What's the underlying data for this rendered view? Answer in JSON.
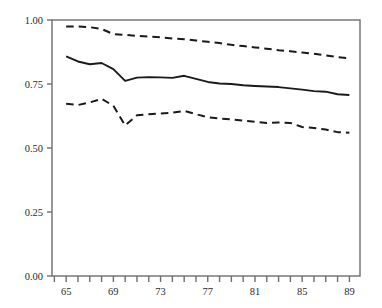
{
  "chart_data": {
    "type": "line",
    "title": "",
    "xlabel": "",
    "ylabel": "",
    "xlim": [
      63.8,
      89.9
    ],
    "ylim": [
      0.0,
      1.0
    ],
    "grid": false,
    "legend": "none",
    "y_ticks": [
      "0.00",
      "0.25",
      "0.50",
      "0.75",
      "1.00"
    ],
    "y_tick_values": [
      0.0,
      0.25,
      0.5,
      0.75,
      1.0
    ],
    "x_ticks": [
      "65",
      "69",
      "73",
      "77",
      "81",
      "85",
      "89"
    ],
    "x_tick_values": [
      65,
      69,
      73,
      77,
      81,
      85,
      89
    ],
    "x_minor_tick_values": [
      64,
      66,
      67,
      68,
      70,
      71,
      72,
      74,
      75,
      76,
      78,
      79,
      80,
      82,
      83,
      84,
      86,
      87,
      88
    ],
    "x": [
      65,
      66,
      67,
      68,
      69,
      70,
      71,
      72,
      73,
      74,
      75,
      76,
      77,
      78,
      79,
      80,
      81,
      82,
      83,
      84,
      85,
      86,
      87,
      88,
      89
    ],
    "series": [
      {
        "name": "upper-confidence-band",
        "style": "dashed",
        "color": "#1a1a1a",
        "values": [
          0.975,
          0.975,
          0.972,
          0.965,
          0.945,
          0.942,
          0.938,
          0.935,
          0.932,
          0.928,
          0.925,
          0.92,
          0.915,
          0.91,
          0.903,
          0.898,
          0.893,
          0.888,
          0.882,
          0.878,
          0.873,
          0.868,
          0.862,
          0.855,
          0.85
        ]
      },
      {
        "name": "point-estimate",
        "style": "solid",
        "color": "#1a1a1a",
        "values": [
          0.858,
          0.838,
          0.827,
          0.832,
          0.808,
          0.762,
          0.775,
          0.777,
          0.776,
          0.774,
          0.782,
          0.77,
          0.758,
          0.752,
          0.75,
          0.745,
          0.742,
          0.74,
          0.738,
          0.733,
          0.728,
          0.722,
          0.72,
          0.71,
          0.707
        ]
      },
      {
        "name": "lower-confidence-band",
        "style": "dashed",
        "color": "#1a1a1a",
        "values": [
          0.673,
          0.668,
          0.678,
          0.692,
          0.665,
          0.588,
          0.628,
          0.632,
          0.635,
          0.638,
          0.645,
          0.632,
          0.62,
          0.615,
          0.612,
          0.607,
          0.602,
          0.598,
          0.6,
          0.598,
          0.582,
          0.578,
          0.572,
          0.562,
          0.56
        ]
      }
    ]
  }
}
